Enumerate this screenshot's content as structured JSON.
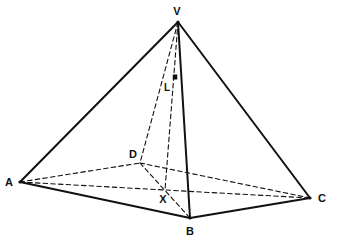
{
  "figure": {
    "background_color": "#ffffff",
    "line_color": "#111111",
    "ghost_color": "#d2d0cc",
    "ghost_text_line1": "",
    "ghost_text_line2": "",
    "labels": {
      "apex": "V",
      "base_front_left": "A",
      "base_front_bottom": "B",
      "base_front_right": "C",
      "base_back": "D",
      "center": "X",
      "right_angle": "L"
    },
    "points": {
      "V": {
        "x": 178,
        "y": 22
      },
      "A": {
        "x": 20,
        "y": 182
      },
      "B": {
        "x": 190,
        "y": 218
      },
      "C": {
        "x": 310,
        "y": 198
      },
      "D": {
        "x": 140,
        "y": 163
      },
      "X": {
        "x": 165,
        "y": 190
      },
      "dot": {
        "x": 175,
        "y": 77
      }
    },
    "label_positions": {
      "V": {
        "x": 177,
        "y": 15
      },
      "A": {
        "x": 9,
        "y": 186
      },
      "B": {
        "x": 190,
        "y": 235
      },
      "C": {
        "x": 322,
        "y": 202
      },
      "D": {
        "x": 133,
        "y": 158
      },
      "X": {
        "x": 163,
        "y": 203
      },
      "L": {
        "x": 167,
        "y": 91
      }
    },
    "edges_solid": [
      {
        "name": "VA",
        "from": "V",
        "to": "A"
      },
      {
        "name": "VB",
        "from": "V",
        "to": "B"
      },
      {
        "name": "VC",
        "from": "V",
        "to": "C"
      },
      {
        "name": "AB",
        "from": "A",
        "to": "B"
      },
      {
        "name": "BC",
        "from": "B",
        "to": "C"
      }
    ],
    "edges_dashed": [
      {
        "name": "VD",
        "from": "V",
        "to": "D"
      },
      {
        "name": "VX-altitude",
        "from": "V",
        "to": "X"
      },
      {
        "name": "AD",
        "from": "A",
        "to": "D"
      },
      {
        "name": "DC",
        "from": "D",
        "to": "C"
      },
      {
        "name": "AC-diagonal",
        "from": "A",
        "to": "C"
      },
      {
        "name": "DB-diagonal",
        "from": "D",
        "to": "B"
      }
    ]
  }
}
